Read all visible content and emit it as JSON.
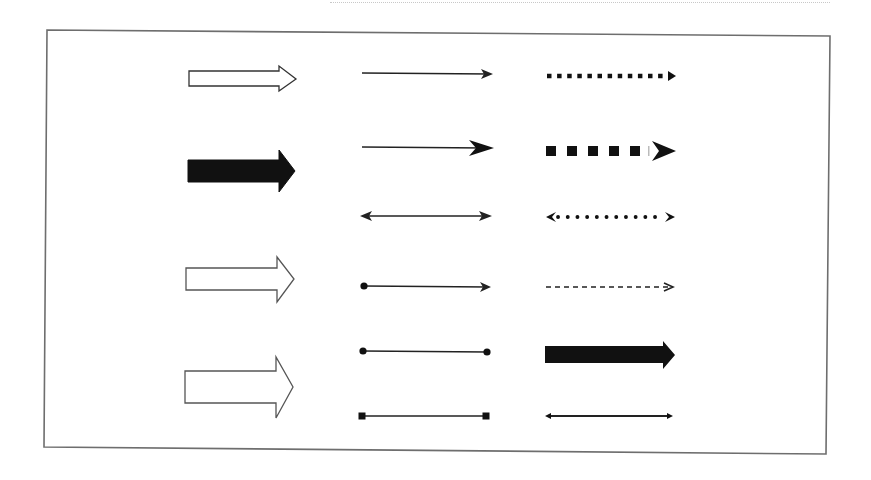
{
  "diagram": {
    "colors": {
      "stroke": "#1a1a1a",
      "frame": "#6e6e6e",
      "background": "#ffffff"
    },
    "frame": {
      "points": [
        [
          47,
          30
        ],
        [
          830,
          36
        ],
        [
          826,
          454
        ],
        [
          44,
          447
        ]
      ]
    },
    "columns": [
      {
        "name": "block-arrows",
        "items": [
          {
            "id": "block-outline-small",
            "style": "outline",
            "x": 189,
            "y": 78,
            "length": 107,
            "shaft": 14,
            "head_w": 24,
            "head_l": 18
          },
          {
            "id": "block-filled-large",
            "style": "filled",
            "x": 188,
            "y": 171,
            "length": 107,
            "shaft": 22,
            "head_w": 42,
            "head_l": 16
          },
          {
            "id": "block-outline-medium",
            "style": "outline",
            "x": 186,
            "y": 279,
            "length": 107,
            "shaft": 22,
            "head_w": 44,
            "head_l": 17
          },
          {
            "id": "block-outline-large",
            "style": "outline",
            "x": 185,
            "y": 386,
            "length": 107,
            "shaft": 32,
            "head_w": 60,
            "head_l": 17
          }
        ]
      },
      {
        "name": "line-arrows",
        "items": [
          {
            "id": "line-arrow-thin",
            "x1": 362,
            "x2": 493,
            "y": 74,
            "start": "none",
            "end": "arrow-small"
          },
          {
            "id": "line-arrow-large-head",
            "x1": 362,
            "x2": 493,
            "y": 148,
            "start": "none",
            "end": "arrow-large"
          },
          {
            "id": "line-double-arrow",
            "x1": 361,
            "x2": 491,
            "y": 216,
            "start": "arrow-small",
            "end": "arrow-small"
          },
          {
            "id": "line-dot-to-arrow",
            "x1": 363,
            "x2": 491,
            "y": 287,
            "start": "dot",
            "end": "arrow-small"
          },
          {
            "id": "line-dot-to-dot",
            "x1": 363,
            "x2": 487,
            "y": 351,
            "start": "dot",
            "end": "dot"
          },
          {
            "id": "line-square-to-square",
            "x1": 362,
            "x2": 486,
            "y": 416,
            "start": "square",
            "end": "square"
          }
        ]
      },
      {
        "name": "dashed-arrows",
        "items": [
          {
            "id": "dotted-square-arrow",
            "x1": 547,
            "x2": 676,
            "y": 76,
            "pattern": "small-squares",
            "end": "arrow-filled-small"
          },
          {
            "id": "dashed-large-squares-arrow",
            "x1": 546,
            "x2": 676,
            "y": 151,
            "pattern": "large-squares",
            "end": "arrow-swept"
          },
          {
            "id": "dotted-round-double-arrow",
            "x1": 546,
            "x2": 675,
            "y": 217,
            "pattern": "round-dots",
            "end": "arrow-swept-both"
          },
          {
            "id": "dashed-thin-arrow",
            "x1": 546,
            "x2": 674,
            "y": 287,
            "pattern": "short-dashes",
            "end": "arrow-open-small"
          },
          {
            "id": "thick-block-arrow",
            "x1": 545,
            "x2": 675,
            "y": 355,
            "pattern": "solid-thick",
            "end": "block"
          },
          {
            "id": "thin-double-arrow",
            "x1": 545,
            "x2": 673,
            "y": 416,
            "pattern": "solid",
            "end": "arrow-small-both"
          }
        ]
      }
    ]
  }
}
